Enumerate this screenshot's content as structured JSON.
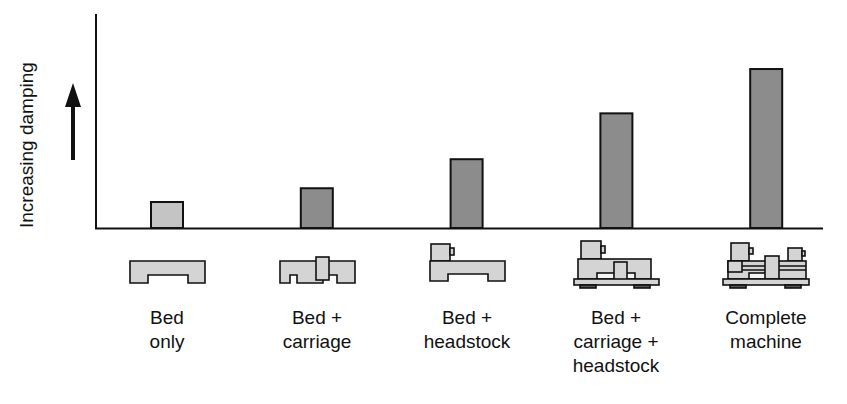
{
  "chart_data": {
    "type": "bar",
    "title": "",
    "xlabel": "",
    "ylabel": "Increasing damping",
    "ylabel_arrow": "up",
    "categories": [
      "Bed only",
      "Bed + carriage",
      "Bed + headstock",
      "Bed + carriage + headstock",
      "Complete machine"
    ],
    "category_lines": [
      [
        "Bed",
        "only"
      ],
      [
        "Bed +",
        "carriage"
      ],
      [
        "Bed +",
        "headstock"
      ],
      [
        "Bed +",
        "carriage +",
        "headstock"
      ],
      [
        "Complete",
        "machine"
      ]
    ],
    "values": [
      1.7,
      2.6,
      4.5,
      7.5,
      10.4
    ],
    "value_units": "relative (unlabeled axis)",
    "ylim": [
      0,
      14
    ],
    "grid": false,
    "legend": null,
    "bar_colors": [
      "#c4c4c4",
      "#8c8c8c",
      "#8c8c8c",
      "#8c8c8c",
      "#8c8c8c"
    ],
    "icons": [
      "lathe-bed-icon",
      "lathe-bed-carriage-icon",
      "lathe-bed-headstock-icon",
      "lathe-bed-carriage-headstock-icon",
      "lathe-complete-machine-icon"
    ]
  }
}
